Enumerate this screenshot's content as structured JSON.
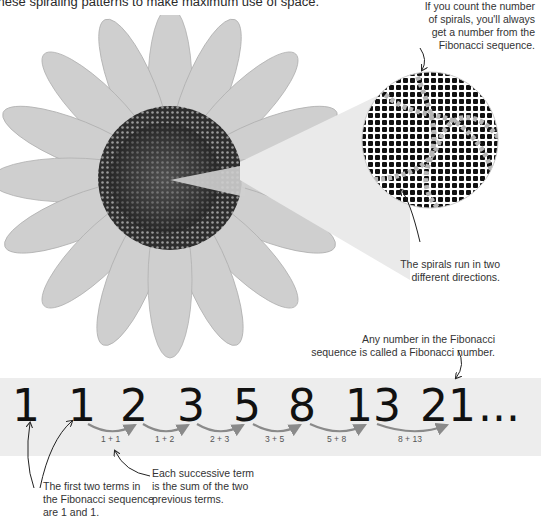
{
  "intro_text": "these spiraling patterns to make maximum use of space.",
  "annotations": {
    "spiral_count": [
      "If you count the number",
      "of spirals, you'll always",
      "get a number from the",
      "Fibonacci sequence."
    ],
    "two_directions": [
      "The spirals run in two",
      "different directions."
    ],
    "fibonacci_number": [
      "Any number in the Fibonacci",
      "sequence is called a Fibonacci number."
    ],
    "first_terms": [
      "The first two terms in",
      "the Fibonacci sequence",
      "are 1 and 1."
    ],
    "successive_term": [
      "Each successive term",
      "is the sum of the two",
      "previous terms."
    ]
  },
  "sequence": {
    "terms": [
      "1",
      "1",
      "2",
      "3",
      "5",
      "8",
      "13",
      "21"
    ],
    "ellipsis": "...",
    "sums": [
      "1 + 1",
      "1 + 2",
      "2 + 3",
      "3 + 5",
      "5 + 8",
      "8 + 13"
    ]
  },
  "colors": {
    "band": "#ededed",
    "arrow": "#8a8a8a",
    "text": "#111111"
  }
}
